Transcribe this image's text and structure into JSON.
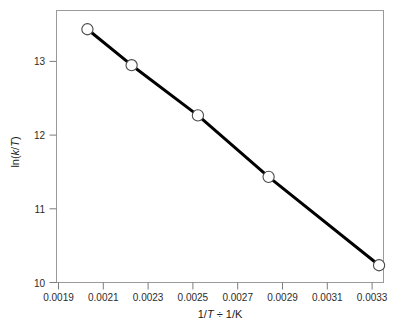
{
  "chart_data": {
    "type": "line",
    "title": "",
    "xlabel": "1/T ÷ 1/K",
    "ylabel": "ln(k/T)",
    "xlabel_parts": {
      "pre": "1/",
      "ital1": "T",
      "mid": " ÷ 1/K"
    },
    "ylabel_parts": {
      "pre": "ln(",
      "ital1": "k",
      "mid": "/",
      "ital2": "T",
      "post": ")"
    },
    "x": [
      0.002,
      0.0022,
      0.0025,
      0.00282,
      0.00332
    ],
    "y": [
      13.33,
      12.85,
      12.18,
      11.36,
      10.18
    ],
    "series": [
      {
        "name": "Eyring plot",
        "points": [
          {
            "x": 0.002,
            "y": 13.33
          },
          {
            "x": 0.0022,
            "y": 12.85
          },
          {
            "x": 0.0025,
            "y": 12.18
          },
          {
            "x": 0.00282,
            "y": 11.36
          },
          {
            "x": 0.00332,
            "y": 10.18
          }
        ]
      }
    ],
    "xlim": [
      0.00186,
      0.00334
    ],
    "ylim": [
      9.95,
      13.58
    ],
    "xticks": [
      0.0019,
      0.0021,
      0.0023,
      0.0025,
      0.0027,
      0.0029,
      0.0031,
      0.0033
    ],
    "xticklabels": [
      "0.0019",
      "0.0021",
      "0.0023",
      "0.0025",
      "0.0027",
      "0.0029",
      "0.0031",
      "0.0033"
    ],
    "yticks": [
      10,
      11,
      12,
      13
    ],
    "yticklabels": [
      "10",
      "11",
      "12",
      "13"
    ],
    "grid": false,
    "legend": "none",
    "marker": "open-circle",
    "line_color": "#000000",
    "marker_fill": "#ffffff",
    "marker_edge": "#4a4a4a",
    "frame_color": "#9a9a9a"
  }
}
